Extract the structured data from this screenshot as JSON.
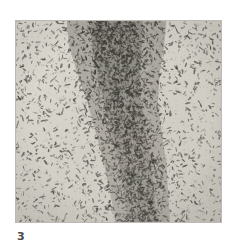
{
  "figure": {
    "number_label": "3",
    "caption": "",
    "plate": {
      "kind": "micrograph",
      "description": "Histological section showing a dense vertical band of darkly stained elongated cells running top-to-bottom through the centre, with sparsely scattered cells on pale background to left and right.",
      "background_color": "#d2cfc8",
      "cell_color": "#3a3833",
      "dense_band_color": "#4d4a44",
      "page_color": "#ffffff",
      "border_color": "#bdbab3"
    },
    "geometry": {
      "plate_x": 15,
      "plate_y": 20,
      "plate_width": 207,
      "plate_height": 203,
      "label_x": 17,
      "label_y": 231
    },
    "band_path": {
      "description": "Centre-line x position of the dense cell band at sampled vertical fractions",
      "samples": [
        {
          "y_frac": 0.0,
          "center_x_frac": 0.49,
          "half_width_frac": 0.24,
          "density": 1.0
        },
        {
          "y_frac": 0.12,
          "center_x_frac": 0.49,
          "half_width_frac": 0.23,
          "density": 0.98
        },
        {
          "y_frac": 0.25,
          "center_x_frac": 0.5,
          "half_width_frac": 0.2,
          "density": 0.92
        },
        {
          "y_frac": 0.4,
          "center_x_frac": 0.52,
          "half_width_frac": 0.17,
          "density": 0.86
        },
        {
          "y_frac": 0.55,
          "center_x_frac": 0.55,
          "half_width_frac": 0.16,
          "density": 0.82
        },
        {
          "y_frac": 0.7,
          "center_x_frac": 0.58,
          "half_width_frac": 0.15,
          "density": 0.8
        },
        {
          "y_frac": 0.85,
          "center_x_frac": 0.6,
          "half_width_frac": 0.14,
          "density": 0.78
        },
        {
          "y_frac": 1.0,
          "center_x_frac": 0.62,
          "half_width_frac": 0.13,
          "density": 0.74
        }
      ]
    },
    "texture": {
      "sparse_cell_count": 1500,
      "dense_cell_count": 4200,
      "cell_length_px": [
        1.6,
        5.0
      ],
      "cell_thickness_px": [
        0.7,
        1.7
      ],
      "grain_count": 2600
    }
  }
}
